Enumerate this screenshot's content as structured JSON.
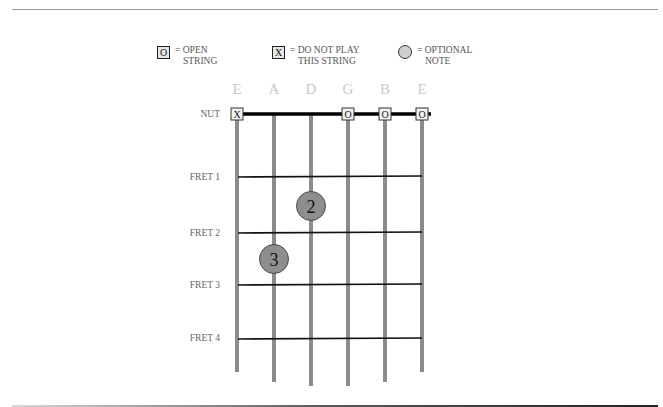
{
  "legend": {
    "open": {
      "symbol": "O",
      "line1": "= OPEN",
      "line2": "STRING"
    },
    "muted": {
      "symbol": "X",
      "line1": "= DO NOT PLAY",
      "line2": "THIS STRING"
    },
    "optional": {
      "line1": "= OPTIONAL",
      "line2": "NOTE"
    }
  },
  "strings": [
    "E",
    "A",
    "D",
    "G",
    "B",
    "E"
  ],
  "rows": {
    "nut": "NUT",
    "fret1": "FRET 1",
    "fret2": "FRET 2",
    "fret3": "FRET 3",
    "fret4": "FRET 4"
  },
  "nut_markers": [
    "X",
    "",
    "",
    "O",
    "O",
    "O"
  ],
  "notes": [
    {
      "string": "D",
      "fret": 1,
      "finger": "2"
    },
    {
      "string": "A",
      "fret": 2,
      "finger": "3"
    }
  ],
  "colors": {
    "string": "#8c8c8c",
    "fret": "#111111",
    "note_fill": "#8e8e8e",
    "legend_circle": "#d0d0d0"
  }
}
